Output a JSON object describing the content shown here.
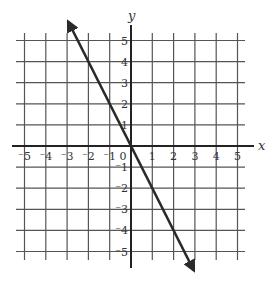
{
  "chart_data": {
    "type": "line",
    "title": "",
    "xlabel": "x",
    "ylabel": "y",
    "xlim": [
      -5.5,
      5.5
    ],
    "ylim": [
      -5.5,
      5.5
    ],
    "grid": true,
    "x_ticks": [
      -5,
      -4,
      -3,
      -2,
      -1,
      0,
      1,
      2,
      3,
      4,
      5
    ],
    "y_ticks": [
      -5,
      -4,
      -3,
      -2,
      -1,
      1,
      2,
      3,
      4,
      5
    ],
    "x_tick_labels": [
      "⁻5",
      "⁻4",
      "⁻3",
      "⁻2",
      "⁻1",
      "0",
      "1",
      "2",
      "3",
      "4",
      "5"
    ],
    "y_tick_labels": [
      "5",
      "4",
      "3",
      "2",
      "1",
      "⁻1",
      "⁻2",
      "⁻3",
      "⁻4",
      "⁻5"
    ],
    "series": [
      {
        "name": "y = -2x",
        "equation": "y = -2x",
        "slope": -2,
        "intercept": 0,
        "x": [
          -2.95,
          2.95
        ],
        "y": [
          5.9,
          -5.9
        ],
        "arrows_both_ends": true
      }
    ],
    "colors": {
      "grid": "#555555",
      "axis": "#222222",
      "line": "#2a2a2a"
    }
  }
}
